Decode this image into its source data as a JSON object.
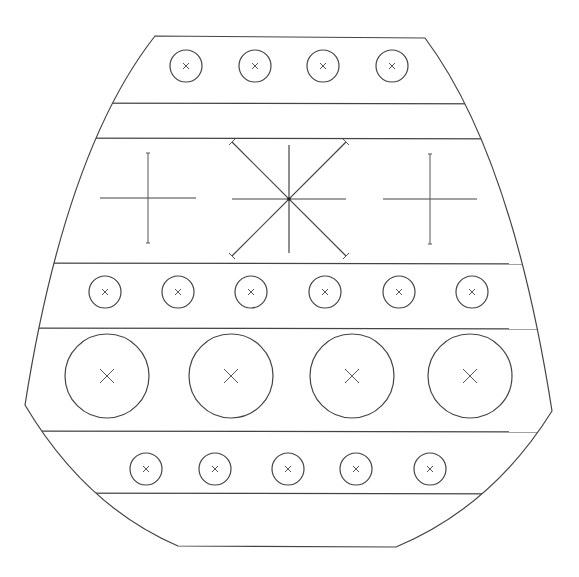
{
  "diagram": {
    "stroke_color": "#444444",
    "background": "#ffffff",
    "outline": {
      "top_left": [
        155,
        36
      ],
      "top_right": [
        425,
        38
      ],
      "left_waist": [
        25,
        405
      ],
      "right_waist": [
        552,
        411
      ],
      "bottom_left": [
        178,
        546
      ],
      "bottom_right": [
        396,
        547
      ]
    },
    "band_lines_y": [
      103,
      138,
      263,
      328,
      431,
      493
    ],
    "rows": [
      {
        "name": "top-row",
        "cy": 66,
        "r": 16,
        "mark_size": 3,
        "cx": [
          186,
          255,
          323,
          392
        ]
      },
      {
        "name": "middle-small-row",
        "cy": 292,
        "r": 16,
        "mark_size": 3,
        "cx": [
          105,
          178,
          251,
          325,
          399,
          472
        ]
      },
      {
        "name": "large-row",
        "cy": 376,
        "r": 42,
        "mark_size": 7,
        "cx": [
          107,
          231,
          352,
          470
        ]
      },
      {
        "name": "bottom-row",
        "cy": 469,
        "r": 16,
        "mark_size": 3,
        "cx": [
          146,
          215,
          288,
          356,
          430
        ]
      }
    ],
    "crosshairs": [
      {
        "name": "left-cross",
        "cx": 148,
        "cy": 198,
        "h_half": 48,
        "v_half": 45
      },
      {
        "name": "right-cross",
        "cx": 430,
        "cy": 199,
        "h_half": 47,
        "v_half": 45
      }
    ],
    "star": {
      "name": "center-star",
      "cx": 289,
      "cy": 199,
      "h_half": 57,
      "v_half": 54,
      "diag": 57
    }
  }
}
